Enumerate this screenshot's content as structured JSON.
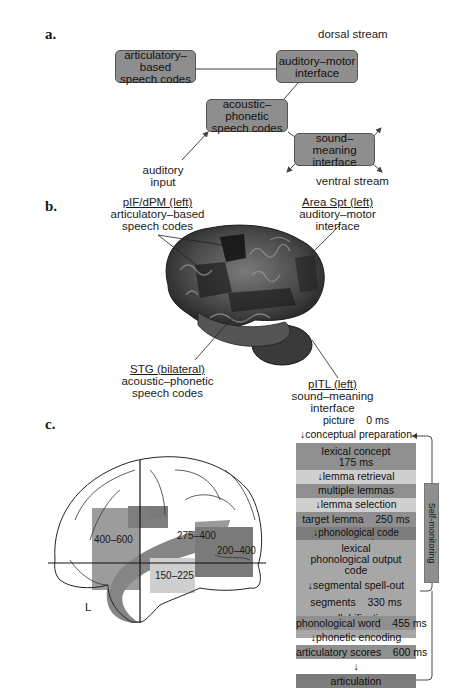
{
  "panel_a": {
    "label": "a.",
    "dorsal_stream": "dorsal stream",
    "ventral_stream": "ventral stream",
    "auditory_input": [
      "auditory",
      "input"
    ],
    "boxes": {
      "articulatory": [
        "articulatory–based",
        "speech codes"
      ],
      "auditory_motor": [
        "auditory–motor",
        "interface"
      ],
      "acoustic_phonetic": [
        "acoustic–phonetic",
        "speech codes"
      ],
      "sound_meaning": [
        "sound–meaning",
        "interface"
      ]
    }
  },
  "panel_b": {
    "label": "b.",
    "regions": {
      "pif": {
        "title": "pIF/dPM (left)",
        "desc": [
          "articulatory–based",
          "speech codes"
        ]
      },
      "spt": {
        "title": "Area Spt (left)",
        "desc": [
          "auditory–motor interface"
        ]
      },
      "stg": {
        "title": "STG (bilateral)",
        "desc": [
          "acoustic–phonetic",
          "speech codes"
        ]
      },
      "pitl": {
        "title": "pITL (left)",
        "desc": [
          "sound–meaning interface"
        ]
      }
    }
  },
  "panel_c": {
    "label": "c.",
    "hemisphere": "L",
    "regions": [
      "400–600",
      "275–400",
      "200–400",
      "150–225"
    ],
    "flow": {
      "picture": "picture    0 ms",
      "conceptual_preparation": "↓conceptual preparation",
      "lexical_concept": [
        "lexical concept",
        "175 ms"
      ],
      "lemma_retrieval": "↓lemma retrieval",
      "multiple_lemmas": "multiple lemmas",
      "lemma_selection": "↓lemma selection",
      "target_lemma": "target lemma    250 ms",
      "phonological_code_retrieval": "↓phonological code retrieval",
      "lexical_output_code": [
        "lexical",
        "phonological output",
        "code"
      ],
      "segmental_spell_out": "↓segmental spell-out",
      "segments": "segments    330 ms",
      "syllabification": "↓syllabification",
      "phonological_word": "phonological word    455 ms",
      "phonetic_encoding": "↓phonetic encoding",
      "articulatory_scores": "articulatory scores    600 ms",
      "arrow": "↓",
      "articulation": "articulation",
      "self_monitoring": "Self-monitoring"
    }
  },
  "colors": {
    "box_gray": "#8e8e8e",
    "light_gray": "#cfcfcf",
    "dark_region": "#7a7a7a",
    "mid_region": "#9c9c9c"
  }
}
